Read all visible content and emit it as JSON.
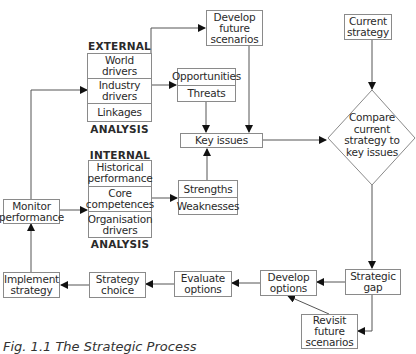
{
  "diagram": {
    "external": {
      "header": "EXTERNAL",
      "footer": "ANALYSIS",
      "items": [
        "World drivers",
        "Industry drivers",
        "Linkages"
      ]
    },
    "internal": {
      "header": "INTERNAL",
      "footer": "ANALYSIS",
      "items": [
        "Historical performance",
        "Core competences",
        "Organisation drivers"
      ]
    },
    "develop_future_scenarios": "Develop future scenarios",
    "current_strategy": "Current strategy",
    "opportunities_threats": [
      "Opportunities",
      "Threats"
    ],
    "strengths_weaknesses": [
      "Strengths",
      "Weaknesses"
    ],
    "key_issues": "Key issues",
    "compare": "Compare current strategy to key issues",
    "monitor_performance": "Monitor performance",
    "implement_strategy": "Implement strategy",
    "strategy_choice": "Strategy choice",
    "evaluate_options": "Evaluate options",
    "develop_options": "Develop options",
    "strategic_gap": "Strategic gap",
    "revisit_future_scenarios": "Revisit future scenarios",
    "caption": "Fig. 1.1  The Strategic Process",
    "colors": {
      "line": "#555555",
      "border": "#8a8a8a",
      "text": "#2a2a2a"
    }
  }
}
